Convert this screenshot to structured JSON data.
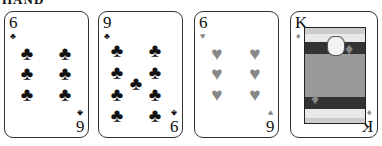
{
  "title": "HAND",
  "colors": {
    "black_suit": "#111111",
    "red_suit_rendered": "#888888",
    "card_border": "#333333"
  },
  "cards": [
    {
      "rank": "6",
      "suit": "clubs",
      "suit_glyph": "♣",
      "color": "black",
      "pips": [
        [
          22,
          41
        ],
        [
          60,
          41
        ],
        [
          22,
          61
        ],
        [
          60,
          61
        ],
        [
          22,
          82
        ],
        [
          60,
          82
        ]
      ]
    },
    {
      "rank": "9",
      "suit": "clubs",
      "suit_glyph": "♣",
      "color": "black",
      "pips": [
        [
          18,
          38
        ],
        [
          56,
          38
        ],
        [
          18,
          60
        ],
        [
          56,
          60
        ],
        [
          37,
          71
        ],
        [
          18,
          82
        ],
        [
          56,
          82
        ],
        [
          18,
          103
        ],
        [
          56,
          103
        ]
      ]
    },
    {
      "rank": "6",
      "suit": "hearts",
      "suit_glyph": "♥",
      "color": "grey",
      "pips": [
        [
          22,
          41
        ],
        [
          60,
          41
        ],
        [
          22,
          61
        ],
        [
          60,
          61
        ],
        [
          22,
          82
        ],
        [
          60,
          82
        ]
      ]
    },
    {
      "rank": "K",
      "suit": "diamonds",
      "suit_glyph": "♦",
      "color": "grey",
      "face_card": true
    }
  ]
}
